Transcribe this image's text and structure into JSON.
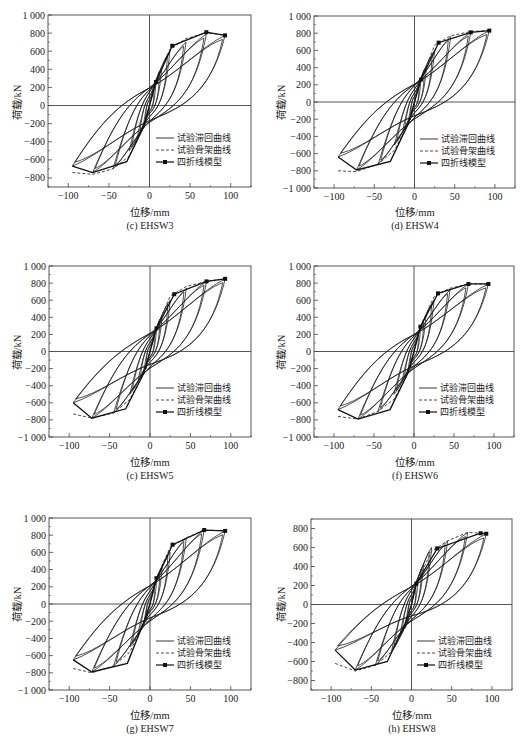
{
  "figure": {
    "legend": [
      "试验滞回曲线",
      "试验骨架曲线",
      "四折线模型"
    ],
    "xlabel": "位移/mm",
    "ylabel": "荷载/kN",
    "xticks": [
      -100,
      -50,
      0,
      50,
      100
    ]
  },
  "chart_data": [
    {
      "type": "line",
      "title": "(c) EHSW3",
      "xlabel": "位移/mm",
      "ylabel": "荷载/kN",
      "xlim": [
        -125,
        125
      ],
      "ylim": [
        -900,
        1000
      ],
      "xticks": [
        -100,
        -50,
        0,
        50,
        100
      ],
      "yticks": [
        1000,
        800,
        600,
        400,
        200,
        0,
        -200,
        -400,
        -600,
        -800
      ],
      "legend": [
        "试验滞回曲线",
        "试验骨架曲线",
        "四折线模型"
      ],
      "legend_position": "lower right",
      "series": [
        {
          "name": "四折线模型",
          "x": [
            -95,
            -70,
            -28,
            -8,
            0,
            8,
            28,
            70,
            93
          ],
          "y": [
            -670,
            -740,
            -620,
            -250,
            0,
            260,
            660,
            810,
            775
          ]
        },
        {
          "name": "试验骨架曲线",
          "x": [
            -95,
            -70,
            -45,
            -25,
            -8,
            0,
            8,
            25,
            45,
            70,
            93
          ],
          "y": [
            -740,
            -760,
            -700,
            -560,
            -250,
            0,
            260,
            620,
            740,
            800,
            780
          ]
        }
      ],
      "peaks": [
        [
          -95,
          -670
        ],
        [
          -70,
          -740
        ],
        [
          -45,
          -700
        ],
        [
          45,
          700
        ],
        [
          70,
          790
        ],
        [
          93,
          775
        ]
      ]
    },
    {
      "type": "line",
      "title": "(d) EHSW4",
      "xlabel": "位移/mm",
      "ylabel": "荷载/kN",
      "xlim": [
        -125,
        125
      ],
      "ylim": [
        -1000,
        1000
      ],
      "xticks": [
        -100,
        -50,
        0,
        50,
        100
      ],
      "yticks": [
        1000,
        800,
        600,
        400,
        200,
        0,
        -200,
        -400,
        -600,
        -800,
        -1000
      ],
      "legend": [
        "试验滞回曲线",
        "试验骨架曲线",
        "四折线模型"
      ],
      "legend_position": "lower right",
      "series": [
        {
          "name": "四折线模型",
          "x": [
            -95,
            -72,
            -30,
            -8,
            0,
            8,
            30,
            70,
            93
          ],
          "y": [
            -640,
            -790,
            -690,
            -260,
            0,
            260,
            690,
            810,
            830
          ]
        },
        {
          "name": "试验骨架曲线",
          "x": [
            -95,
            -72,
            -45,
            -25,
            -8,
            0,
            8,
            25,
            45,
            70,
            93
          ],
          "y": [
            -800,
            -810,
            -720,
            -560,
            -260,
            0,
            260,
            660,
            770,
            820,
            830
          ]
        }
      ],
      "peaks": [
        [
          -95,
          -640
        ],
        [
          -72,
          -790
        ],
        [
          -45,
          -720
        ],
        [
          45,
          760
        ],
        [
          70,
          810
        ],
        [
          93,
          830
        ]
      ]
    },
    {
      "type": "line",
      "title": "(c) EHSW5",
      "xlabel": "位移/mm",
      "ylabel": "荷载/kN",
      "xlim": [
        -125,
        125
      ],
      "ylim": [
        -1000,
        1000
      ],
      "xticks": [
        -100,
        -50,
        0,
        50,
        100
      ],
      "yticks": [
        1000,
        800,
        600,
        400,
        200,
        0,
        -200,
        -400,
        -600,
        -800,
        -1000
      ],
      "legend": [
        "试验滞回曲线",
        "试验骨架曲线",
        "四折线模型"
      ],
      "legend_position": "lower right",
      "series": [
        {
          "name": "四折线模型",
          "x": [
            -95,
            -72,
            -30,
            -8,
            0,
            8,
            30,
            70,
            93
          ],
          "y": [
            -600,
            -780,
            -670,
            -260,
            0,
            270,
            670,
            820,
            850
          ]
        },
        {
          "name": "试验骨架曲线",
          "x": [
            -95,
            -72,
            -45,
            -25,
            -8,
            0,
            8,
            25,
            45,
            70,
            93
          ],
          "y": [
            -730,
            -780,
            -720,
            -560,
            -260,
            0,
            270,
            650,
            760,
            820,
            850
          ]
        }
      ],
      "peaks": [
        [
          -95,
          -600
        ],
        [
          -72,
          -780
        ],
        [
          -45,
          -720
        ],
        [
          45,
          740
        ],
        [
          70,
          820
        ],
        [
          93,
          850
        ]
      ]
    },
    {
      "type": "line",
      "title": "(f) EHSW6",
      "xlabel": "位移/mm",
      "ylabel": "荷载/kN",
      "xlim": [
        -125,
        125
      ],
      "ylim": [
        -1000,
        1000
      ],
      "xticks": [
        -100,
        -50,
        0,
        50,
        100
      ],
      "yticks": [
        1000,
        800,
        600,
        400,
        200,
        0,
        -200,
        -400,
        -600,
        -800,
        -1000
      ],
      "legend": [
        "试验滞回曲线",
        "试验骨架曲线",
        "四折线模型"
      ],
      "legend_position": "lower right",
      "series": [
        {
          "name": "四折线模型",
          "x": [
            -95,
            -70,
            -30,
            -8,
            0,
            8,
            30,
            68,
            93
          ],
          "y": [
            -680,
            -790,
            -680,
            -260,
            0,
            290,
            680,
            790,
            790
          ]
        },
        {
          "name": "试验骨架曲线",
          "x": [
            -95,
            -70,
            -45,
            -25,
            -8,
            0,
            8,
            25,
            45,
            68,
            93
          ],
          "y": [
            -760,
            -790,
            -700,
            -560,
            -260,
            0,
            290,
            640,
            740,
            790,
            790
          ]
        }
      ],
      "peaks": [
        [
          -95,
          -680
        ],
        [
          -70,
          -790
        ],
        [
          -45,
          -700
        ],
        [
          45,
          720
        ],
        [
          68,
          790
        ],
        [
          93,
          790
        ]
      ]
    },
    {
      "type": "line",
      "title": "(g) EHSW7",
      "xlabel": "位移/mm",
      "ylabel": "荷载/kN",
      "xlim": [
        -125,
        125
      ],
      "ylim": [
        -1000,
        1000
      ],
      "xticks": [
        -100,
        -50,
        0,
        50,
        100
      ],
      "yticks": [
        1000,
        800,
        600,
        400,
        200,
        0,
        -200,
        -400,
        -600,
        -800,
        -1000
      ],
      "legend": [
        "试验滞回曲线",
        "试验骨架曲线",
        "四折线模型"
      ],
      "legend_position": "lower right",
      "series": [
        {
          "name": "四折线模型",
          "x": [
            -95,
            -72,
            -28,
            -8,
            0,
            8,
            28,
            67,
            93
          ],
          "y": [
            -650,
            -790,
            -690,
            -220,
            0,
            300,
            690,
            860,
            850
          ]
        },
        {
          "name": "试验骨架曲线",
          "x": [
            -95,
            -72,
            -45,
            -25,
            -8,
            0,
            8,
            25,
            45,
            67,
            93
          ],
          "y": [
            -750,
            -800,
            -720,
            -560,
            -220,
            0,
            300,
            660,
            770,
            860,
            850
          ]
        }
      ],
      "peaks": [
        [
          -95,
          -650
        ],
        [
          -72,
          -790
        ],
        [
          -45,
          -720
        ],
        [
          45,
          770
        ],
        [
          67,
          860
        ],
        [
          93,
          850
        ]
      ]
    },
    {
      "type": "line",
      "title": "(h) EHSW8",
      "xlabel": "位移/mm",
      "ylabel": "荷载/kN",
      "xlim": [
        -125,
        125
      ],
      "ylim": [
        -900,
        900
      ],
      "xticks": [
        -100,
        -50,
        0,
        50,
        100
      ],
      "yticks": [
        800,
        600,
        400,
        200,
        0,
        -200,
        -400,
        -600,
        -800
      ],
      "legend": [
        "试验滞回曲线",
        "试验骨架曲线",
        "四折线模型"
      ],
      "legend_position": "lower right",
      "series": [
        {
          "name": "四折线模型",
          "x": [
            -95,
            -70,
            -30,
            -8,
            0,
            6,
            32,
            86,
            93
          ],
          "y": [
            -480,
            -690,
            -600,
            -200,
            0,
            220,
            590,
            750,
            745
          ]
        },
        {
          "name": "试验骨架曲线",
          "x": [
            -95,
            -70,
            -45,
            -25,
            -8,
            0,
            6,
            25,
            45,
            70,
            93
          ],
          "y": [
            -620,
            -700,
            -640,
            -500,
            -200,
            0,
            220,
            560,
            670,
            760,
            745
          ]
        }
      ],
      "peaks": [
        [
          -95,
          -480
        ],
        [
          -70,
          -690
        ],
        [
          -45,
          -640
        ],
        [
          45,
          670
        ],
        [
          70,
          760
        ],
        [
          93,
          745
        ]
      ]
    }
  ]
}
